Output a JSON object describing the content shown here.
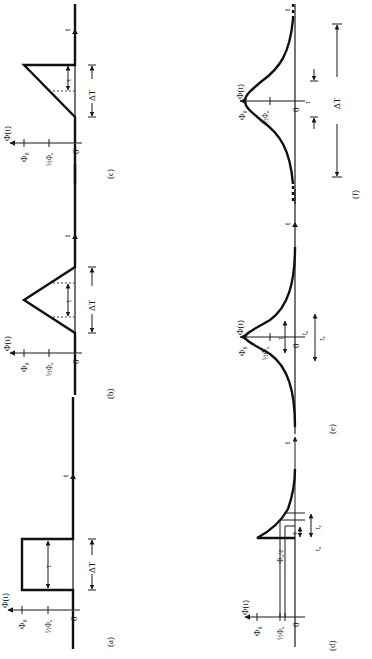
{
  "figure": {
    "orientation": "rotated 90 degrees counter-clockwise",
    "background": "#ffffff",
    "ink_color": "#1a1a1a",
    "panels": [
      {
        "id": "a",
        "caption": "(a)",
        "shape": "rectangular pulse",
        "y_axis_label": "Φ(t)",
        "x_axis_label": "t",
        "y_ticks": [
          "Φ₀",
          "½Φ₀",
          "0"
        ],
        "annotations": [
          "τ",
          "ΔT"
        ]
      },
      {
        "id": "b",
        "caption": "(b)",
        "shape": "triangular pulse",
        "y_axis_label": "Φ(t)",
        "x_axis_label": "t",
        "y_ticks": [
          "Φ₀",
          "½Φ₀",
          "0"
        ],
        "annotations": [
          "τ",
          "ΔT"
        ]
      },
      {
        "id": "c",
        "caption": "(c)",
        "shape": "linear ramp with abrupt drop (sawtooth)",
        "y_axis_label": "Φ(t)",
        "x_axis_label": "t",
        "y_ticks": [
          "Φ₀",
          "½Φ₀",
          "0"
        ],
        "annotations": [
          "τ",
          "ΔT"
        ]
      },
      {
        "id": "d",
        "caption": "(d)",
        "shape": "abrupt rise then exponential decay",
        "y_axis_label": "Φ(t)",
        "x_axis_label": "t",
        "y_ticks": [
          "Φ₀",
          "½Φ₀",
          "Φ₀/e",
          "0"
        ],
        "annotations": [
          "τ",
          "τₑ",
          "t₀"
        ]
      },
      {
        "id": "e",
        "caption": "(e)",
        "shape": "Gaussian pulse",
        "y_axis_label": "Φ(t)",
        "x_axis_label": "t",
        "y_ticks": [
          "Φ₀",
          "½Φ₀",
          "0"
        ],
        "annotations": [
          "τ",
          "τₑ",
          "t₀"
        ]
      },
      {
        "id": "f",
        "caption": "(f)",
        "shape": "bell-shaped pulse with long tails",
        "y_axis_label": "Φ(t)",
        "x_axis_label": "t",
        "y_ticks": [
          "Φ₀",
          "½Φ₀",
          "0"
        ],
        "annotations": [
          "τ",
          "ΔT"
        ]
      }
    ]
  },
  "labels": {
    "phi_t": "Φ(t)",
    "phi0": "Φ₀",
    "half_phi0": "½Φ₀",
    "phi0_over_e": "Φ₀/e",
    "zero": "0",
    "t": "t",
    "tau": "τ",
    "tau_e": "τₑ",
    "t0": "t₀",
    "delta_T": "ΔT",
    "cap_a": "(a)",
    "cap_b": "(b)",
    "cap_c": "(c)",
    "cap_d": "(d)",
    "cap_e": "(e)",
    "cap_f": "(f)"
  }
}
